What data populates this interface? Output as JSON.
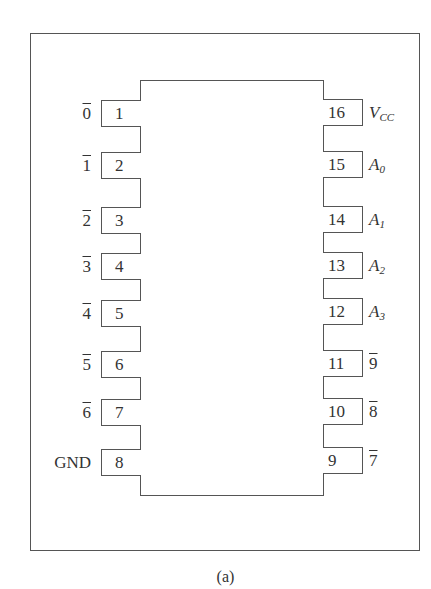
{
  "figure": {
    "caption": "(a)",
    "chip": {
      "pin_count": 16
    },
    "left_pins": [
      {
        "number": "1",
        "label": "0",
        "overline": true,
        "y": 100
      },
      {
        "number": "2",
        "label": "1",
        "overline": true,
        "y": 152
      },
      {
        "number": "3",
        "label": "2",
        "overline": true,
        "y": 207
      },
      {
        "number": "4",
        "label": "3",
        "overline": true,
        "y": 253
      },
      {
        "number": "5",
        "label": "4",
        "overline": true,
        "y": 300
      },
      {
        "number": "6",
        "label": "5",
        "overline": true,
        "y": 351
      },
      {
        "number": "7",
        "label": "6",
        "overline": true,
        "y": 399
      },
      {
        "number": "8",
        "label": "GND",
        "overline": false,
        "y": 449
      }
    ],
    "right_pins": [
      {
        "number": "16",
        "label": "V",
        "subscript": "CC",
        "italic": true,
        "y": 99
      },
      {
        "number": "15",
        "label": "A",
        "subscript": "0",
        "italic": true,
        "y": 151
      },
      {
        "number": "14",
        "label": "A",
        "subscript": "1",
        "italic": true,
        "y": 206
      },
      {
        "number": "13",
        "label": "A",
        "subscript": "2",
        "italic": true,
        "y": 252
      },
      {
        "number": "12",
        "label": "A",
        "subscript": "3",
        "italic": true,
        "y": 298
      },
      {
        "number": "11",
        "label": "9",
        "overline": true,
        "y": 350
      },
      {
        "number": "10",
        "label": "8",
        "overline": true,
        "y": 398
      },
      {
        "number": "9",
        "label": "7",
        "overline": true,
        "y": 447
      }
    ]
  }
}
